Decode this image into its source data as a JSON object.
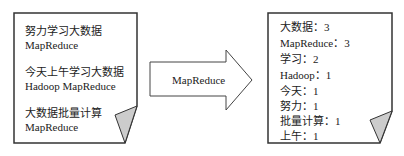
{
  "input_doc": {
    "lines": [
      {
        "text": "努力学习大数据",
        "y": 14
      },
      {
        "text": "MapReduce",
        "y": 28
      },
      {
        "text": "今天上午学习大数据",
        "y": 55
      },
      {
        "text": "Hadoop MapReduce",
        "y": 69
      },
      {
        "text": "大数据批量计算",
        "y": 96
      },
      {
        "text": "MapReduce",
        "y": 110
      }
    ]
  },
  "arrow": {
    "label": "MapReduce"
  },
  "output_doc": {
    "lines": [
      {
        "text": "大数据：3"
      },
      {
        "text": "MapReduce：3"
      },
      {
        "text": "学习：2"
      },
      {
        "text": "Hadoop：1"
      },
      {
        "text": "今天：1"
      },
      {
        "text": "努力：1"
      },
      {
        "text": "批量计算：1"
      },
      {
        "text": "上午：1"
      }
    ]
  },
  "colors": {
    "stroke": "#333333",
    "fold_fill": "#cccccc",
    "background": "#ffffff"
  }
}
